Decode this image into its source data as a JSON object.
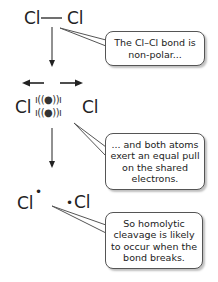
{
  "step1": {
    "left_atom": "Cl",
    "bond": "—",
    "right_atom": "Cl",
    "note": "The Cl–Cl bond is non-polar..."
  },
  "step2": {
    "left_atom": "Cl",
    "electron_pair_top": "ı((●))ı",
    "electron_pair_bottom": "ı((●))ı",
    "right_atom": "Cl",
    "note": "... and both atoms exert an equal pull on the shared electrons."
  },
  "step3": {
    "left_radical": "Cl",
    "left_dot": "•",
    "right_dot": "•",
    "right_radical": "Cl",
    "note": "So homolytic cleavage is likely to occur when the bond breaks."
  },
  "colors": {
    "ink": "#222222",
    "bubble_border": "#555555",
    "background": "#ffffff"
  }
}
